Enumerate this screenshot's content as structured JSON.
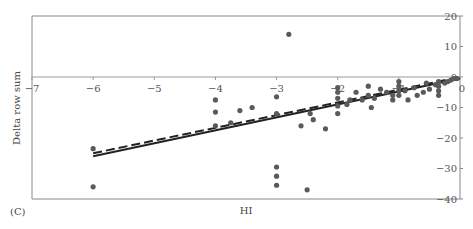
{
  "panel_label": "(C)",
  "chart_data": {
    "type": "scatter",
    "title": "",
    "xlabel": "HI",
    "ylabel": "Delta row sum",
    "xlim": [
      -7,
      0
    ],
    "ylim": [
      -40,
      20
    ],
    "grid": false,
    "legend": null,
    "x_ticks": [
      "-7",
      "-6",
      "-5",
      "-4",
      "-3",
      "-2",
      "-1",
      "0"
    ],
    "y_ticks": [
      "20",
      "10",
      "0",
      "-10",
      "-20",
      "-30",
      "-40"
    ],
    "y_axis_position": "right",
    "x_axis_at_y": 0,
    "colors": {
      "points": "#5a5a5a",
      "fit_solid": "#222222",
      "fit_dashed": "#222222",
      "frame": "#888888"
    },
    "series": [
      {
        "name": "observations",
        "type": "scatter",
        "points": [
          [
            -6.0,
            -23.5
          ],
          [
            -6.0,
            -36.0
          ],
          [
            -4.0,
            -7.5
          ],
          [
            -4.0,
            -11.5
          ],
          [
            -4.0,
            -16.0
          ],
          [
            -3.75,
            -15.0
          ],
          [
            -3.6,
            -11.0
          ],
          [
            -3.4,
            -10.0
          ],
          [
            -3.0,
            -6.5
          ],
          [
            -3.0,
            -12.0
          ],
          [
            -3.0,
            -29.5
          ],
          [
            -3.0,
            -32.5
          ],
          [
            -3.0,
            -35.5
          ],
          [
            -2.8,
            14.0
          ],
          [
            -2.6,
            -16.0
          ],
          [
            -2.5,
            -37.0
          ],
          [
            -2.45,
            -12.0
          ],
          [
            -2.4,
            -14.0
          ],
          [
            -2.2,
            -17.0
          ],
          [
            -2.0,
            -3.5
          ],
          [
            -2.0,
            -5.0
          ],
          [
            -2.0,
            -7.0
          ],
          [
            -2.0,
            -9.5
          ],
          [
            -2.0,
            -12.0
          ],
          [
            -1.85,
            -9.0
          ],
          [
            -1.8,
            -7.5
          ],
          [
            -1.7,
            -5.0
          ],
          [
            -1.6,
            -7.5
          ],
          [
            -1.5,
            -3.0
          ],
          [
            -1.5,
            -6.0
          ],
          [
            -1.45,
            -10.0
          ],
          [
            -1.4,
            -7.0
          ],
          [
            -1.3,
            -4.0
          ],
          [
            -1.2,
            -5.0
          ],
          [
            -1.1,
            -6.0
          ],
          [
            -1.1,
            -7.5
          ],
          [
            -1.0,
            -1.5
          ],
          [
            -1.0,
            -3.0
          ],
          [
            -1.0,
            -4.5
          ],
          [
            -1.0,
            -6.0
          ],
          [
            -0.9,
            -4.5
          ],
          [
            -0.85,
            -7.5
          ],
          [
            -0.75,
            -3.5
          ],
          [
            -0.7,
            -6.0
          ],
          [
            -0.6,
            -5.0
          ],
          [
            -0.55,
            -2.0
          ],
          [
            -0.5,
            -4.0
          ],
          [
            -0.4,
            -2.5
          ],
          [
            -0.35,
            -1.5
          ],
          [
            -0.35,
            -3.0
          ],
          [
            -0.35,
            -4.5
          ],
          [
            -0.35,
            -6.0
          ],
          [
            -0.25,
            -2.0
          ],
          [
            -0.2,
            -1.5
          ],
          [
            -0.15,
            -1.0
          ],
          [
            -0.1,
            -0.5
          ],
          [
            -0.05,
            -0.5
          ]
        ]
      },
      {
        "name": "fit (solid)",
        "type": "line",
        "x": [
          -6.0,
          0.0
        ],
        "y": [
          -26.0,
          -0.5
        ]
      },
      {
        "name": "fit (dashed)",
        "type": "line",
        "dash": true,
        "x": [
          -6.0,
          0.0
        ],
        "y": [
          -25.0,
          0.0
        ]
      }
    ]
  }
}
